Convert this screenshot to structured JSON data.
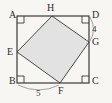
{
  "figure": {
    "kind": "geometry-diagram",
    "background_color": "#f7f6f3",
    "stroke_color": "#3a3a3a",
    "inner_fill_color": "#e2e2e2",
    "label_color": "#2e2e2e"
  },
  "outer_square": {
    "name": "ABCD",
    "corners": [
      {
        "id": "A",
        "label": "A",
        "position": "top-left",
        "x": 17,
        "y": 16,
        "right_angle_mark": true
      },
      {
        "id": "D",
        "label": "D",
        "position": "top-right",
        "x": 89,
        "y": 16,
        "right_angle_mark": true
      },
      {
        "id": "C",
        "label": "C",
        "position": "bottom-right",
        "x": 89,
        "y": 83,
        "right_angle_mark": true
      },
      {
        "id": "B",
        "label": "B",
        "position": "bottom-left",
        "x": 17,
        "y": 83,
        "right_angle_mark": true
      }
    ]
  },
  "inner_square": {
    "name": "EFGH",
    "filled": true,
    "vertices": [
      {
        "id": "H",
        "label": "H",
        "on_edge": "top",
        "x": 52,
        "y": 16
      },
      {
        "id": "G",
        "label": "G",
        "on_edge": "right",
        "x": 89,
        "y": 42
      },
      {
        "id": "F",
        "label": "F",
        "on_edge": "bottom",
        "x": 60,
        "y": 83
      },
      {
        "id": "E",
        "label": "E",
        "on_edge": "left",
        "x": 17,
        "y": 52
      }
    ]
  },
  "measurements": [
    {
      "id": "measure-4",
      "value": "4",
      "segment": "D-G",
      "side": "right",
      "has_brace": true
    },
    {
      "id": "measure-5",
      "value": "5",
      "segment": "B-F",
      "side": "bottom",
      "has_brace": true
    }
  ]
}
